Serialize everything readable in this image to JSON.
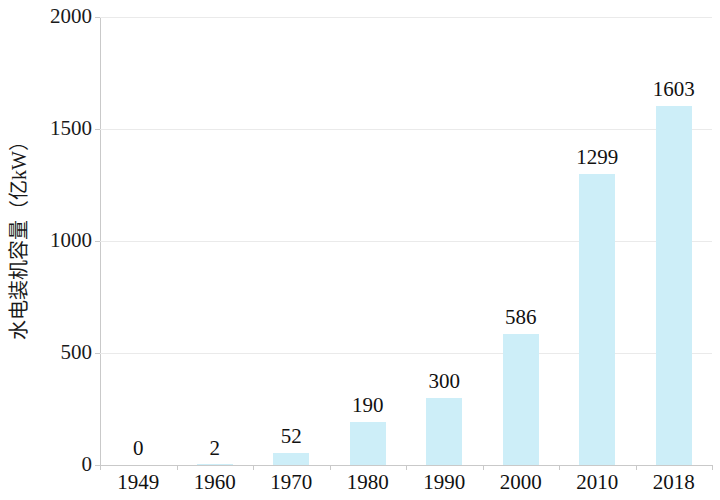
{
  "chart_data": {
    "type": "bar",
    "title": "",
    "subtitle": "",
    "xlabel": "",
    "ylabel": "水电装机容量（亿kW）",
    "categories": [
      "1949",
      "1960",
      "1970",
      "1980",
      "1990",
      "2000",
      "2010",
      "2018"
    ],
    "values": [
      0,
      2,
      52,
      190,
      300,
      586,
      1299,
      1603
    ],
    "data_labels": [
      "0",
      "2",
      "52",
      "190",
      "300",
      "586",
      "1299",
      "1603"
    ],
    "ylim": [
      0,
      2000
    ],
    "y_ticks": [
      0,
      500,
      1000,
      1500,
      2000
    ],
    "y_tick_labels": [
      "0",
      "500",
      "1000",
      "1500",
      "2000"
    ],
    "grid": true,
    "grid_axis": "y",
    "legend": false,
    "legend_position": "none",
    "series": [
      {
        "name": "水电装机容量",
        "values": [
          0,
          2,
          52,
          190,
          300,
          586,
          1299,
          1603
        ]
      }
    ],
    "colors": {
      "bar_fill": "#cdeef8",
      "gridline": "#eaeaea",
      "axis_line": "#c9c9c9",
      "text": "#111111",
      "background": "#ffffff"
    }
  }
}
